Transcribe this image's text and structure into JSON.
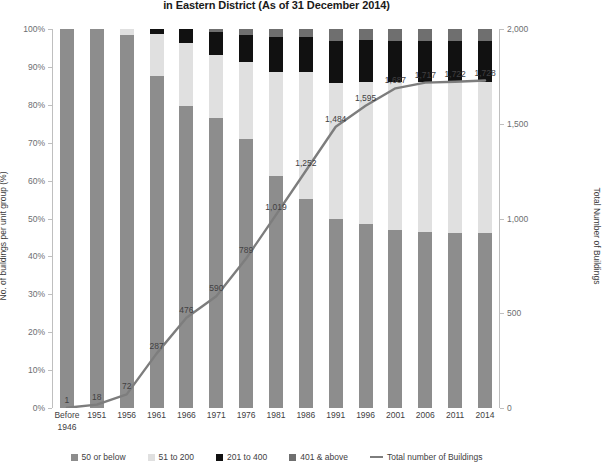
{
  "chart_data": {
    "type": "bar",
    "title": "in Eastern District (As of 31 December 2014)",
    "xlabel": "",
    "ylabel": "No. of buildings per unit group (%)",
    "y2label": "Total Number of Buildings",
    "ylim": [
      0,
      100
    ],
    "y2lim": [
      0,
      2000
    ],
    "grid": false,
    "legend_position": "bottom",
    "categories": [
      "Before\n1946",
      "1951",
      "1956",
      "1961",
      "1966",
      "1971",
      "1976",
      "1981",
      "1986",
      "1991",
      "1996",
      "2001",
      "2006",
      "2011",
      "2014"
    ],
    "ytick_labels": [
      "0%",
      "10%",
      "20%",
      "30%",
      "40%",
      "50%",
      "60%",
      "70%",
      "80%",
      "90%",
      "100%"
    ],
    "ytick_values": [
      0,
      10,
      20,
      30,
      40,
      50,
      60,
      70,
      80,
      90,
      100
    ],
    "y2tick_labels": [
      "0",
      "500",
      "1,000",
      "1,500",
      "2,000"
    ],
    "y2tick_values": [
      0,
      500,
      1000,
      1500,
      2000
    ],
    "series": [
      {
        "name": "50 or below",
        "color": "#8d8d8d",
        "values": [
          100,
          100,
          98.5,
          87.7,
          79.6,
          76.6,
          71.0,
          61.2,
          55.2,
          49.8,
          48.5,
          47.0,
          46.5,
          46.3,
          46.3
        ]
      },
      {
        "name": "51 to 200",
        "color": "#e0e0e0",
        "values": [
          0,
          0,
          1.5,
          11.0,
          16.6,
          16.5,
          20.3,
          27.5,
          33.5,
          36.0,
          37.5,
          39.0,
          39.4,
          39.6,
          39.6
        ]
      },
      {
        "name": "201 to 400",
        "color": "#111111",
        "values": [
          0,
          0,
          0,
          1.3,
          3.8,
          6.0,
          7.0,
          9.1,
          9.1,
          11.0,
          11.0,
          10.8,
          11.0,
          11.0,
          11.0
        ]
      },
      {
        "name": "401 & above",
        "color": "#6f6f6f",
        "values": [
          0,
          0,
          0,
          0,
          0,
          0.9,
          1.7,
          2.2,
          2.2,
          3.2,
          3.0,
          3.2,
          3.1,
          3.1,
          3.1
        ]
      }
    ],
    "line_series": {
      "name": "Total number of Buildings",
      "color": "#7d7d7d",
      "axis": "right",
      "values": [
        1,
        18,
        72,
        287,
        476,
        590,
        789,
        1019,
        1252,
        1484,
        1595,
        1687,
        1717,
        1722,
        1728
      ],
      "labels": [
        "1",
        "18",
        "72",
        "287",
        "476",
        "590",
        "789",
        "1,019",
        "1,252",
        "1,484",
        "1,595",
        "1,687",
        "1,717",
        "1,722",
        "1,728"
      ]
    },
    "legend": [
      {
        "label": "50 or below",
        "color": "#8d8d8d",
        "marker": "square"
      },
      {
        "label": "51 to 200",
        "color": "#e0e0e0",
        "marker": "square"
      },
      {
        "label": "201 to 400",
        "color": "#111111",
        "marker": "square"
      },
      {
        "label": "401 & above",
        "color": "#6f6f6f",
        "marker": "square"
      },
      {
        "label": "Total number of Buildings",
        "color": "#7d7d7d",
        "marker": "line"
      }
    ]
  }
}
